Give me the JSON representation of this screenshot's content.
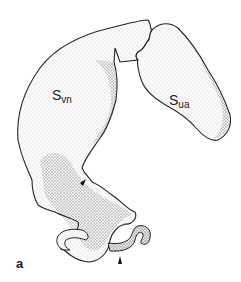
{
  "figure": {
    "panel_label": "a",
    "labels": [
      {
        "main": "S",
        "sub": "vn"
      },
      {
        "main": "S",
        "sub": "ua"
      }
    ],
    "arrowheads": 2,
    "colors": {
      "background": "#ffffff",
      "ink": "#1a1a1a",
      "stipple": "#555555"
    }
  }
}
